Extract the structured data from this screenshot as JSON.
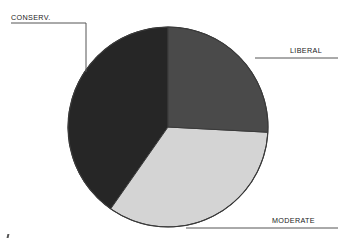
{
  "chart_data": {
    "type": "pie",
    "title": "",
    "subtitle": "",
    "xlabel": "",
    "ylabel": "",
    "grid": false,
    "legend_position": "callout-labels",
    "labels": [
      "LIBERAL",
      "MODERATE",
      "CONSERV."
    ],
    "values": [
      26,
      34,
      40
    ],
    "units": "percent",
    "slices": [
      {
        "name": "LIBERAL",
        "label": "LIBERAL",
        "value": 26,
        "start_angle_deg": 0,
        "end_angle_deg": 93,
        "color": "#4a4a4a",
        "label_position": "right"
      },
      {
        "name": "MODERATE",
        "label": "MODERATE",
        "value": 34,
        "start_angle_deg": 93,
        "end_angle_deg": 215,
        "color": "#d4d4d4",
        "label_position": "bottom-right"
      },
      {
        "name": "CONSERV.",
        "label": "CONSERV.",
        "value": 40,
        "start_angle_deg": 215,
        "end_angle_deg": 360,
        "color": "#262626",
        "label_position": "top-left"
      }
    ],
    "geometry": {
      "center_x": 168,
      "center_y": 127,
      "radius": 100,
      "outline_color": "#3a3a3a",
      "background": "#ffffff"
    },
    "leader_lines": [
      {
        "name": "conserv-leader",
        "path": "M 11 23 H 86 V 72"
      },
      {
        "name": "liberal-leader",
        "path": "M 255 58 H 338"
      },
      {
        "name": "moderate-leader",
        "path": "M 186 228 H 338"
      }
    ]
  },
  "labels": {
    "conserv": "CONSERV.",
    "liberal": "LIBERAL",
    "moderate": "MODERATE"
  },
  "colors": {
    "conserv": "#262626",
    "liberal": "#4a4a4a",
    "moderate": "#d4d4d4",
    "outline": "#3a3a3a",
    "leader": "#555555",
    "background": "#ffffff",
    "text": "#1a1a1a"
  }
}
